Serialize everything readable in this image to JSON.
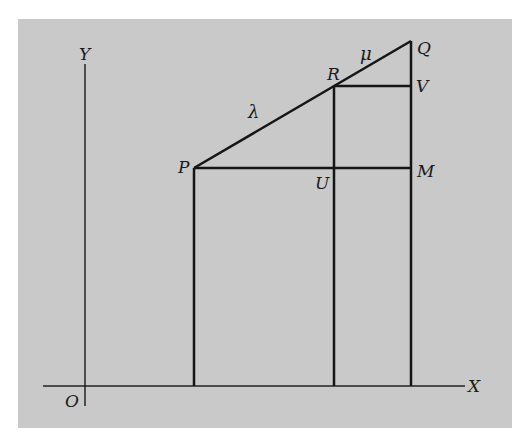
{
  "figure": {
    "background": "#c9c9c9",
    "line_color": "#151515",
    "axes": {
      "x_label": "X",
      "y_label": "Y",
      "origin_label": "O"
    },
    "points": {
      "P": "P",
      "Q": "Q",
      "R": "R",
      "V": "V",
      "M": "M",
      "U": "U"
    },
    "segment_labels": {
      "PR": "λ",
      "RQ": "μ"
    }
  }
}
